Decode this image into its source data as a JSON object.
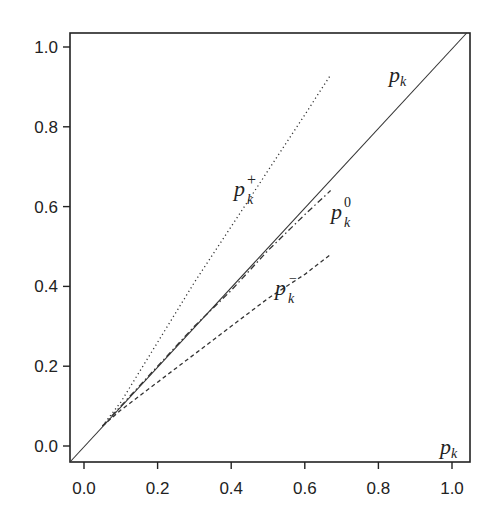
{
  "chart_data": {
    "type": "line",
    "title": "",
    "xlabel": "",
    "ylabel": "",
    "xlim": [
      -0.04,
      1.04
    ],
    "ylim": [
      -0.04,
      1.04
    ],
    "grid": false,
    "legend_position": "inline labels",
    "x_ticks": [
      "0.0",
      "0.2",
      "0.4",
      "0.6",
      "0.8",
      "1.0"
    ],
    "y_ticks": [
      "0.0",
      "0.2",
      "0.4",
      "0.6",
      "0.8",
      "1.0"
    ],
    "series": [
      {
        "name": "p_k",
        "style": "solid",
        "x": [
          -0.04,
          1.04
        ],
        "y": [
          -0.04,
          1.04
        ]
      },
      {
        "name": "p_k^+",
        "style": "dotted",
        "x": [
          0.05,
          0.1,
          0.2,
          0.3,
          0.4,
          0.5,
          0.6,
          0.67
        ],
        "y": [
          0.05,
          0.11,
          0.26,
          0.41,
          0.55,
          0.69,
          0.83,
          0.93
        ]
      },
      {
        "name": "p_k^0",
        "style": "dashdot",
        "x": [
          0.05,
          0.1,
          0.2,
          0.3,
          0.4,
          0.5,
          0.6,
          0.67
        ],
        "y": [
          0.05,
          0.1,
          0.2,
          0.3,
          0.39,
          0.49,
          0.58,
          0.64
        ]
      },
      {
        "name": "p_k^-",
        "style": "dashed",
        "x": [
          0.05,
          0.1,
          0.2,
          0.3,
          0.4,
          0.5,
          0.6,
          0.67
        ],
        "y": [
          0.05,
          0.09,
          0.16,
          0.23,
          0.3,
          0.37,
          0.43,
          0.48
        ]
      }
    ],
    "annotations": [
      {
        "text": "p_k",
        "x": 0.87,
        "y": 0.93,
        "note": "label on solid diagonal"
      },
      {
        "text": "p_k^+",
        "x": 0.43,
        "y": 0.63
      },
      {
        "text": "p_k^0",
        "x": 0.7,
        "y": 0.59
      },
      {
        "text": "p_k^-",
        "x": 0.54,
        "y": 0.4
      },
      {
        "text": "p_k",
        "x": 1.0,
        "y": 0.0,
        "note": "x-axis variable label, bottom right"
      }
    ]
  },
  "labels": {
    "diag_base": "p",
    "diag_sub": "k",
    "plus_base": "p",
    "plus_sub": "k",
    "plus_sup": "+",
    "zero_base": "p",
    "zero_sub": "k",
    "zero_sup": "0",
    "minus_base": "p",
    "minus_sub": "k",
    "minus_sup": "−",
    "axis_base": "p",
    "axis_sub": "k"
  }
}
